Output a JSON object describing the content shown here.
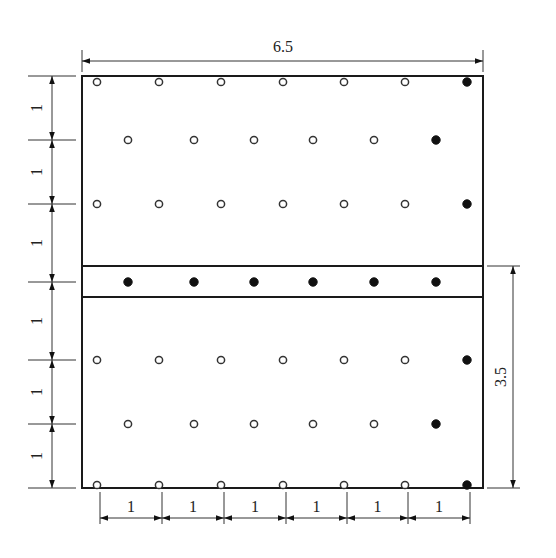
{
  "diagram": {
    "title": "",
    "overall_width_label": "6.5",
    "lower_height_label": "3.5",
    "left_spacing_labels": [
      "1",
      "1",
      "1",
      "1",
      "1",
      "1"
    ],
    "bottom_spacing_labels": [
      "1",
      "1",
      "1",
      "1",
      "1",
      "1"
    ],
    "legend": {
      "open_circle": "open hole",
      "filled_circle": "filled hole"
    },
    "rows": [
      {
        "name": "row-1",
        "pattern": [
          "open",
          "open",
          "open",
          "open",
          "open",
          "open",
          "filled"
        ],
        "offset": "edge"
      },
      {
        "name": "row-2",
        "pattern": [
          "open",
          "open",
          "open",
          "open",
          "open",
          "filled"
        ],
        "offset": "mid"
      },
      {
        "name": "row-3",
        "pattern": [
          "open",
          "open",
          "open",
          "open",
          "open",
          "open",
          "filled"
        ],
        "offset": "edge"
      },
      {
        "name": "row-band",
        "pattern": [
          "filled",
          "filled",
          "filled",
          "filled",
          "filled",
          "filled"
        ],
        "offset": "mid"
      },
      {
        "name": "row-5",
        "pattern": [
          "open",
          "open",
          "open",
          "open",
          "open",
          "open",
          "filled"
        ],
        "offset": "edge"
      },
      {
        "name": "row-6",
        "pattern": [
          "open",
          "open",
          "open",
          "open",
          "open",
          "filled"
        ],
        "offset": "mid"
      },
      {
        "name": "row-7",
        "pattern": [
          "open",
          "open",
          "open",
          "open",
          "open",
          "open",
          "filled"
        ],
        "offset": "edge"
      }
    ]
  }
}
